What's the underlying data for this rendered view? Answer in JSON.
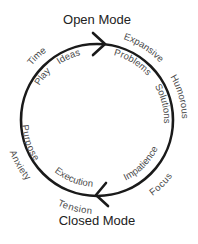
{
  "diagram": {
    "top_label": "Open Mode",
    "bottom_label": "Closed Mode",
    "cycle_direction": "clockwise",
    "colors": {
      "stroke": "#1a1a1a",
      "text": "#4a4a4a",
      "title": "#222222",
      "background": "#ffffff"
    },
    "open_mode_outer": [
      "Time",
      "Expansive",
      "Humorous"
    ],
    "open_mode_inner": [
      "Play",
      "Ideas",
      "Problems",
      "Solutions"
    ],
    "closed_mode_inner": [
      "Impatience",
      "Execution",
      "Purpose"
    ],
    "closed_mode_outer": [
      "Focus",
      "Tension",
      "Anxiety"
    ],
    "labels": {
      "time": "Time",
      "play": "Play",
      "ideas": "Ideas",
      "expansive": "Expansive",
      "humorous": "Humorous",
      "problems": "Problems",
      "solutions": "Solutions",
      "impatience": "Impatience",
      "focus": "Focus",
      "execution": "Execution",
      "tension": "Tension",
      "purpose": "Purpose",
      "anxiety": "Anxiety"
    }
  }
}
